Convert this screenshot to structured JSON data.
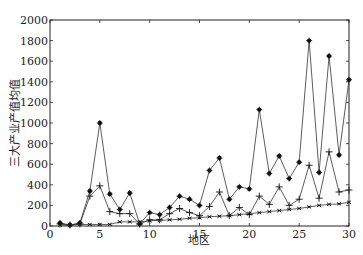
{
  "chart_data": {
    "type": "line",
    "title": "",
    "xlabel": "地区",
    "ylabel": "三大产业产值均值",
    "xlim": [
      0,
      30
    ],
    "ylim": [
      0,
      2000
    ],
    "xticks": [
      0,
      5,
      10,
      15,
      20,
      25,
      30
    ],
    "yticks": [
      0,
      200,
      400,
      600,
      800,
      1000,
      1200,
      1400,
      1600,
      1800,
      2000
    ],
    "grid": false,
    "legend": null,
    "x": [
      1,
      2,
      3,
      4,
      5,
      6,
      7,
      8,
      9,
      10,
      11,
      12,
      13,
      14,
      15,
      16,
      17,
      18,
      19,
      20,
      21,
      22,
      23,
      24,
      25,
      26,
      27,
      28,
      29,
      30
    ],
    "series": [
      {
        "name": "series_star",
        "marker": "star",
        "values": [
          30,
          10,
          30,
          340,
          1000,
          310,
          160,
          320,
          20,
          130,
          110,
          180,
          290,
          260,
          200,
          540,
          660,
          260,
          380,
          360,
          1130,
          510,
          680,
          460,
          620,
          1800,
          520,
          1650,
          690,
          1420
        ]
      },
      {
        "name": "series_plus",
        "marker": "plus",
        "values": [
          20,
          10,
          20,
          290,
          390,
          140,
          120,
          120,
          20,
          60,
          60,
          120,
          170,
          130,
          100,
          190,
          330,
          100,
          180,
          110,
          290,
          210,
          380,
          200,
          260,
          590,
          270,
          720,
          330,
          350
        ]
      },
      {
        "name": "series_dash",
        "marker": "x",
        "values": [
          10,
          10,
          15,
          15,
          15,
          15,
          40,
          40,
          40,
          50,
          55,
          60,
          65,
          75,
          80,
          90,
          95,
          100,
          110,
          120,
          130,
          140,
          150,
          160,
          170,
          185,
          200,
          210,
          215,
          230
        ]
      }
    ]
  }
}
